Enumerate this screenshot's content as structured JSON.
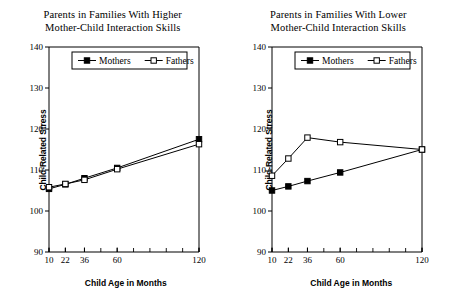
{
  "figure": {
    "background": "#ffffff",
    "ink": "#000000"
  },
  "chart_data": [
    {
      "type": "line",
      "panel": "left",
      "title": "Parents in Families With Higher Mother-Child Interaction Skills",
      "title_line1": "Parents in Families With Higher",
      "title_line2": "Mother-Child Interaction Skills",
      "xlabel": "Child Age in Months",
      "ylabel": "Child-Related Stress",
      "x": [
        10,
        22,
        36,
        60,
        120
      ],
      "categories": [
        "10",
        "22",
        "36",
        "60",
        "120"
      ],
      "xlim": [
        10,
        120
      ],
      "ylim": [
        90,
        140
      ],
      "yticks": [
        90,
        100,
        110,
        120,
        130,
        140
      ],
      "ytick_labels": [
        "90",
        "100",
        "110",
        "120",
        "130",
        "140"
      ],
      "xticks": [
        10,
        22,
        36,
        60,
        120
      ],
      "xtick_labels": [
        "10",
        "22",
        "36",
        "60",
        "120"
      ],
      "xminor_ticks": [
        10,
        22,
        36,
        48,
        60,
        72,
        84,
        96,
        108,
        120
      ],
      "grid": false,
      "legend_position": "top-center",
      "series": [
        {
          "name": "Mothers",
          "marker": "filled-square",
          "values": [
            105.4,
            106.5,
            108.0,
            110.5,
            117.5
          ]
        },
        {
          "name": "Fathers",
          "marker": "open-square",
          "values": [
            105.8,
            106.6,
            107.6,
            110.2,
            116.3
          ]
        }
      ]
    },
    {
      "type": "line",
      "panel": "right",
      "title": "Parents in Families With Lower Mother-Child Interaction Skills",
      "title_line1": "Parents in Families With Lower",
      "title_line2": "Mother-Child Interaction Skills",
      "xlabel": "Child Age in Months",
      "ylabel": "Child-Related Stress",
      "x": [
        10,
        22,
        36,
        60,
        120
      ],
      "categories": [
        "10",
        "22",
        "36",
        "60",
        "120"
      ],
      "xlim": [
        10,
        120
      ],
      "ylim": [
        90,
        140
      ],
      "yticks": [
        90,
        100,
        110,
        120,
        130,
        140
      ],
      "ytick_labels": [
        "90",
        "100",
        "110",
        "120",
        "130",
        "140"
      ],
      "xticks": [
        10,
        22,
        36,
        60,
        120
      ],
      "xtick_labels": [
        "10",
        "22",
        "36",
        "60",
        "120"
      ],
      "xminor_ticks": [
        10,
        22,
        36,
        48,
        60,
        72,
        84,
        96,
        108,
        120
      ],
      "grid": false,
      "legend_position": "top-center",
      "series": [
        {
          "name": "Mothers",
          "marker": "filled-square",
          "values": [
            105.0,
            106.0,
            107.3,
            109.4,
            115.0
          ]
        },
        {
          "name": "Fathers",
          "marker": "open-square",
          "values": [
            108.6,
            112.8,
            117.9,
            116.8,
            115.0
          ]
        }
      ]
    }
  ]
}
